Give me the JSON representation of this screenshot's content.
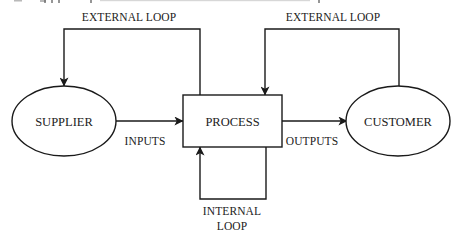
{
  "diagram": {
    "type": "flow-diagram",
    "colors": {
      "stroke": "#1a1a1a",
      "text": "#222222",
      "background": "#ffffff"
    },
    "nodes": {
      "supplier": {
        "label": "SUPPLIER",
        "shape": "ellipse"
      },
      "process": {
        "label": "PROCESS",
        "shape": "rectangle"
      },
      "customer": {
        "label": "CUSTOMER",
        "shape": "ellipse"
      }
    },
    "edges": {
      "inputs": {
        "label": "INPUTS",
        "from": "supplier",
        "to": "process"
      },
      "outputs": {
        "label": "OUTPUTS",
        "from": "process",
        "to": "customer"
      },
      "external_loop_left": {
        "label": "EXTERNAL LOOP",
        "from": "process",
        "to": "supplier"
      },
      "external_loop_right": {
        "label": "EXTERNAL LOOP",
        "from": "customer",
        "to": "process"
      },
      "internal_loop": {
        "label_line1": "INTERNAL",
        "label_line2": "LOOP",
        "from": "process",
        "to": "process"
      }
    }
  }
}
